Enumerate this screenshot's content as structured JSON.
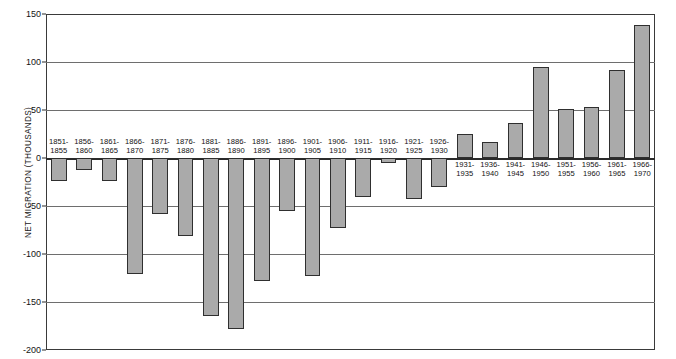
{
  "chart_data": {
    "type": "bar",
    "title": "",
    "subtitle": "",
    "xlabel": "",
    "ylabel": "NET MIGRATION (THOUSANDS)",
    "ylim": [
      -200,
      150
    ],
    "yticks": [
      150,
      100,
      50,
      0,
      -50,
      -100,
      -150,
      -200
    ],
    "ytick_labels": [
      "150",
      "100",
      "50",
      "0",
      "-50",
      "-100",
      "-150",
      "-200"
    ],
    "grid": true,
    "legend": "none",
    "orientation": "vertical",
    "bar_color": "#aaaaaa",
    "bar_edge_color": "#2f2f2f",
    "frame_color": "#3a3a3a",
    "gridline_color": "#6e6e6e",
    "categories": [
      "1851-\n1855",
      "1856-\n1860",
      "1861-\n1865",
      "1866-\n1870",
      "1871-\n1875",
      "1876-\n1880",
      "1881-\n1885",
      "1886-\n1890",
      "1891-\n1895",
      "1896-\n1900",
      "1901-\n1905",
      "1906-\n1910",
      "1911-\n1915",
      "1916-\n1920",
      "1921-\n1925",
      "1926-\n1930",
      "1931-\n1935",
      "1936-\n1940",
      "1941-\n1945",
      "1946-\n1950",
      "1951-\n1955",
      "1956-\n1960",
      "1961-\n1965",
      "1966-\n1970"
    ],
    "values": [
      -24,
      -12,
      -24,
      -121,
      -58,
      -81,
      -165,
      -178,
      -128,
      -55,
      -123,
      -73,
      -41,
      -5,
      -43,
      -30,
      25,
      17,
      36,
      95,
      51,
      53,
      92,
      139
    ],
    "bars": [
      {
        "line1": "1851-",
        "line2": "1855",
        "value": -24
      },
      {
        "line1": "1856-",
        "line2": "1860",
        "value": -12
      },
      {
        "line1": "1861-",
        "line2": "1865",
        "value": -24
      },
      {
        "line1": "1866-",
        "line2": "1870",
        "value": -121
      },
      {
        "line1": "1871-",
        "line2": "1875",
        "value": -58
      },
      {
        "line1": "1876-",
        "line2": "1880",
        "value": -81
      },
      {
        "line1": "1881-",
        "line2": "1885",
        "value": -165
      },
      {
        "line1": "1886-",
        "line2": "1890",
        "value": -178
      },
      {
        "line1": "1891-",
        "line2": "1895",
        "value": -128
      },
      {
        "line1": "1896-",
        "line2": "1900",
        "value": -55
      },
      {
        "line1": "1901-",
        "line2": "1905",
        "value": -123
      },
      {
        "line1": "1906-",
        "line2": "1910",
        "value": -73
      },
      {
        "line1": "1911-",
        "line2": "1915",
        "value": -41
      },
      {
        "line1": "1916-",
        "line2": "1920",
        "value": -5
      },
      {
        "line1": "1921-",
        "line2": "1925",
        "value": -43
      },
      {
        "line1": "1926-",
        "line2": "1930",
        "value": -30
      },
      {
        "line1": "1931-",
        "line2": "1935",
        "value": 25
      },
      {
        "line1": "1936-",
        "line2": "1940",
        "value": 17
      },
      {
        "line1": "1941-",
        "line2": "1945",
        "value": 36
      },
      {
        "line1": "1946-",
        "line2": "1950",
        "value": 95
      },
      {
        "line1": "1951-",
        "line2": "1955",
        "value": 51
      },
      {
        "line1": "1956-",
        "line2": "1960",
        "value": 53
      },
      {
        "line1": "1961-",
        "line2": "1965",
        "value": 92
      },
      {
        "line1": "1966-",
        "line2": "1970",
        "value": 139
      }
    ]
  }
}
